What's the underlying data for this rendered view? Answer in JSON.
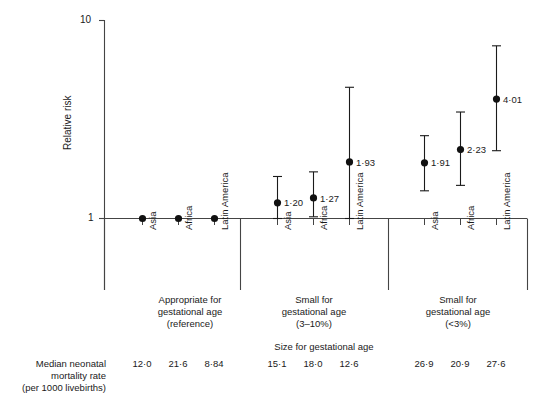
{
  "chart_data": {
    "type": "scatter",
    "title": "",
    "ylabel": "Relative risk",
    "xlabel": "Size for gestational age",
    "yscale": "log",
    "ylim": [
      1,
      10
    ],
    "ytick_labels": [
      "1",
      "10"
    ],
    "ytick_values": [
      1,
      10
    ],
    "grid": false,
    "legend": "none",
    "categories": [
      "Asia",
      "Africa",
      "Latin America"
    ],
    "groups": [
      {
        "label_lines": [
          "Appropriate for",
          "gestational age",
          "(reference)"
        ],
        "points": [
          {
            "region": "Asia",
            "value": 1.0,
            "label": "",
            "low": 1.0,
            "high": 1.0,
            "mortality": "12·0"
          },
          {
            "region": "Africa",
            "value": 1.0,
            "label": "",
            "low": 1.0,
            "high": 1.0,
            "mortality": "21·6"
          },
          {
            "region": "Latin America",
            "value": 1.0,
            "label": "",
            "low": 1.0,
            "high": 1.0,
            "mortality": "8·84"
          }
        ]
      },
      {
        "label_lines": [
          "Small for",
          "gestational age",
          "(3–10%)"
        ],
        "points": [
          {
            "region": "Asia",
            "value": 1.2,
            "label": "1·20",
            "low": 1.0,
            "high": 1.63,
            "mortality": "15·1"
          },
          {
            "region": "Africa",
            "value": 1.27,
            "label": "1·27",
            "low": 1.02,
            "high": 1.72,
            "mortality": "18·0"
          },
          {
            "region": "Latin America",
            "value": 1.93,
            "label": "1·93",
            "low": 1.0,
            "high": 4.6,
            "mortality": "12·6"
          }
        ]
      },
      {
        "label_lines": [
          "Small for",
          "gestational age",
          "(<3%)"
        ],
        "points": [
          {
            "region": "Asia",
            "value": 1.91,
            "label": "1·91",
            "low": 1.38,
            "high": 2.62,
            "mortality": "26·9"
          },
          {
            "region": "Africa",
            "value": 2.23,
            "label": "2·23",
            "low": 1.47,
            "high": 3.45,
            "mortality": "20·9"
          },
          {
            "region": "Latin America",
            "value": 4.01,
            "label": "4·01",
            "low": 2.2,
            "high": 7.45,
            "mortality": "27·6"
          }
        ]
      }
    ]
  },
  "axis": {
    "y_title": "Relative risk",
    "y_top_tick": "10",
    "y_bottom_tick": "1"
  },
  "footer": {
    "x_axis_title": "Size for gestational age",
    "row_label_lines": [
      "Median neonatal",
      "mortality rate",
      "(per 1000 livebirths)"
    ]
  },
  "colors": {
    "ink": "#1a1a1a",
    "axis": "#444444",
    "marker": "#111111"
  }
}
